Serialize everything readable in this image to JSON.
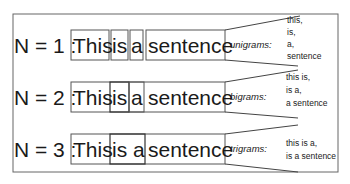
{
  "sentence_words": [
    "This",
    "is",
    "a",
    "sentence"
  ],
  "rows": [
    {
      "n_label": "N = 1 :",
      "words": [
        "This",
        "is",
        "a",
        "sentence"
      ],
      "kind_label": "unigrams:",
      "grams": [
        "this,",
        "is,",
        "a,",
        "sentence"
      ]
    },
    {
      "n_label": "N = 2 :",
      "words": [
        "This",
        "is",
        "a",
        "sentence"
      ],
      "kind_label": "bigrams:",
      "grams": [
        "this is,",
        "is a,",
        "a sentence"
      ]
    },
    {
      "n_label": "N = 3 :",
      "words": [
        "This",
        "is a",
        "sentence"
      ],
      "kind_label": "trigrams:",
      "grams": [
        "this is a,",
        "is a sentence"
      ]
    }
  ]
}
